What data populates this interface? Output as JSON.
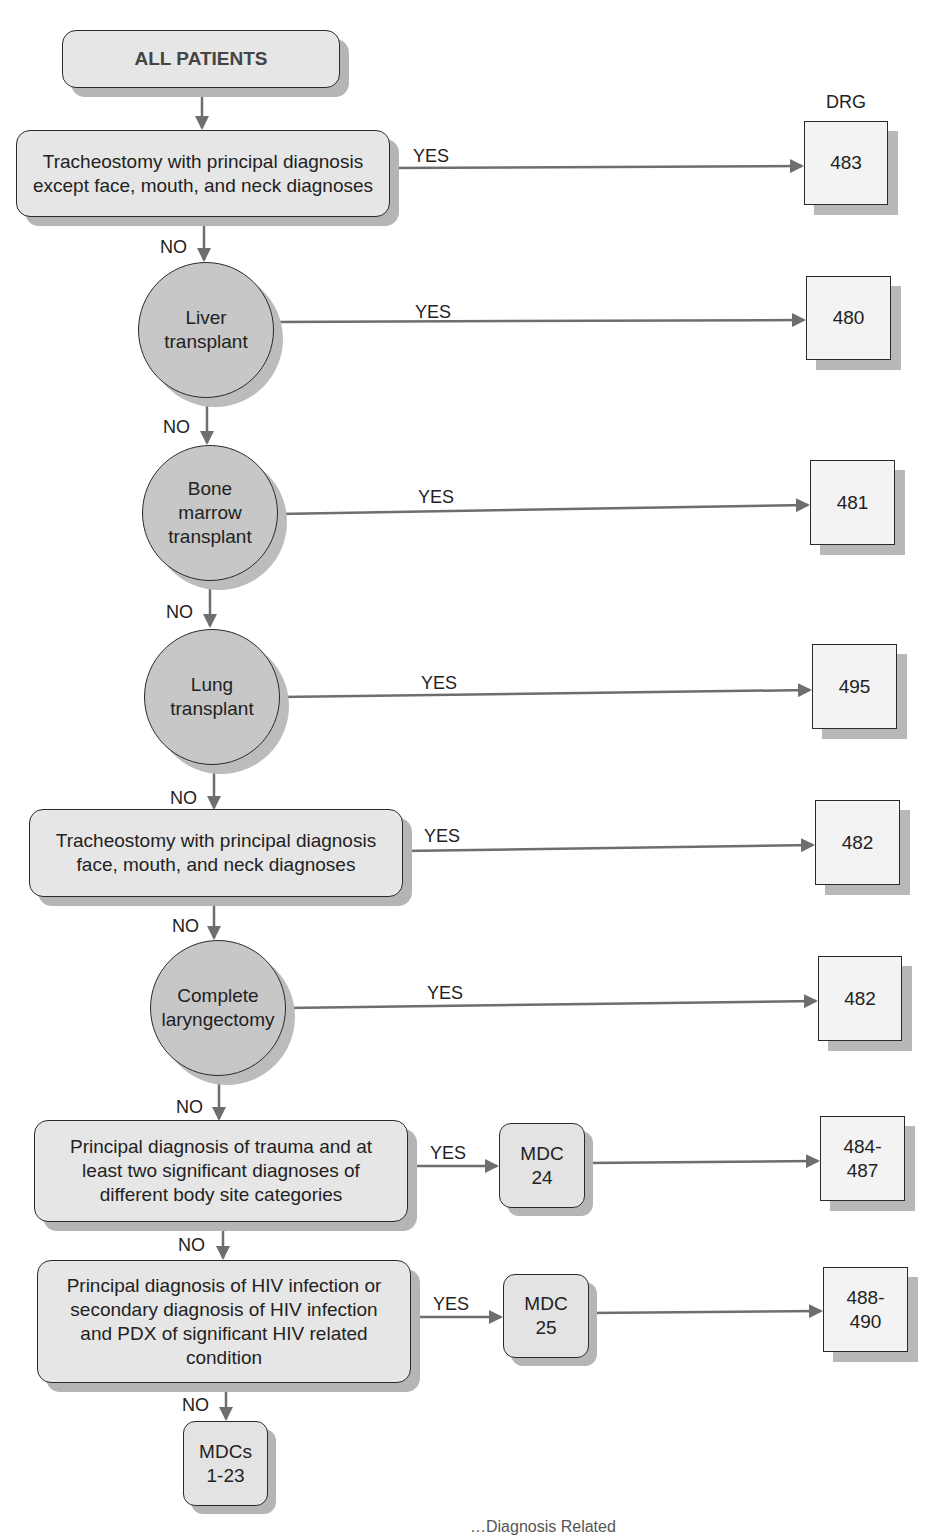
{
  "diagram": {
    "type": "flowchart",
    "column_header": "DRG",
    "start": {
      "label": "ALL PATIENTS"
    },
    "edge_labels": {
      "yes": "YES",
      "no": "NO"
    },
    "decisions": [
      {
        "shape": "rounded-rect",
        "lines": [
          "Tracheostomy with principal diagnosis",
          "except face, mouth, and neck diagnoses"
        ],
        "yes_target": "483"
      },
      {
        "shape": "circle",
        "lines": [
          "Liver",
          "transplant"
        ],
        "yes_target": "480"
      },
      {
        "shape": "circle",
        "lines": [
          "Bone",
          "marrow",
          "transplant"
        ],
        "yes_target": "481"
      },
      {
        "shape": "circle",
        "lines": [
          "Lung",
          "transplant"
        ],
        "yes_target": "495"
      },
      {
        "shape": "rounded-rect",
        "lines": [
          "Tracheostomy with principal diagnosis",
          "face, mouth, and neck diagnoses"
        ],
        "yes_target": "482"
      },
      {
        "shape": "circle",
        "lines": [
          "Complete",
          "laryngectomy"
        ],
        "yes_target": "482"
      },
      {
        "shape": "rounded-rect",
        "lines": [
          "Principal diagnosis of trauma and at",
          "least two significant diagnoses of",
          "different body site categories"
        ],
        "yes_via": [
          "MDC",
          "24"
        ],
        "yes_target_lines": [
          "484-",
          "487"
        ]
      },
      {
        "shape": "rounded-rect",
        "lines": [
          "Principal diagnosis of HIV infection or",
          "secondary diagnosis of HIV infection",
          "and PDX of significant HIV related",
          "condition"
        ],
        "yes_via": [
          "MDC",
          "25"
        ],
        "yes_target_lines": [
          "488-",
          "490"
        ]
      }
    ],
    "drg_boxes": [
      "483",
      "480",
      "481",
      "495",
      "482",
      "482"
    ],
    "final_no": {
      "lines": [
        "MDCs",
        "1-23"
      ]
    },
    "caption_partial": "…Diagnosis Related"
  },
  "colors": {
    "line": "#6e6e6e",
    "rect_fill": "#e6e6e6",
    "circle_fill": "#c7c7c7",
    "drg_fill": "#f3f3f3",
    "shadow": "#b5b5b5",
    "border": "#2a2a2a"
  }
}
